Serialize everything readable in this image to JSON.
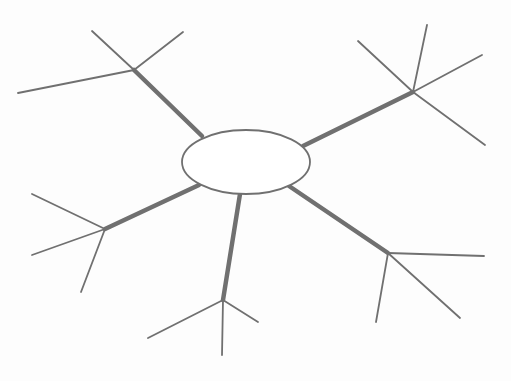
{
  "figure": {
    "type": "node-link-diagram",
    "title": "",
    "width": 511,
    "height": 381,
    "background_color": "#fdfdfd",
    "stroke_color": "#707070",
    "hub_fill_color": "#ffffff",
    "spoke_stroke_width": 4.5,
    "twig_stroke_width": 1.8,
    "hub_stroke_width": 1.8,
    "label_text": ""
  },
  "hub": {
    "name": "central-hub",
    "cx": 246,
    "cy": 162,
    "rx": 64,
    "ry": 32,
    "label": ""
  },
  "nodes": [
    {
      "id": "node-top-left",
      "label": "",
      "x": 134,
      "y": 70
    },
    {
      "id": "node-top-right",
      "label": "",
      "x": 413,
      "y": 92
    },
    {
      "id": "node-left",
      "label": "",
      "x": 105,
      "y": 229
    },
    {
      "id": "node-bottom",
      "label": "",
      "x": 223,
      "y": 300
    },
    {
      "id": "node-bottom-right",
      "label": "",
      "x": 388,
      "y": 253
    }
  ],
  "spokes": [
    {
      "id": "spoke-to-top-left",
      "from": "central-hub",
      "to": "node-top-left",
      "x1": 202,
      "y1": 136,
      "x2": 134,
      "y2": 70
    },
    {
      "id": "spoke-to-top-right",
      "from": "central-hub",
      "to": "node-top-right",
      "x1": 303,
      "y1": 146,
      "x2": 413,
      "y2": 92
    },
    {
      "id": "spoke-to-left",
      "from": "central-hub",
      "to": "node-left",
      "x1": 199,
      "y1": 185,
      "x2": 105,
      "y2": 229
    },
    {
      "id": "spoke-to-bottom",
      "from": "central-hub",
      "to": "node-bottom",
      "x1": 240,
      "y1": 194,
      "x2": 223,
      "y2": 300
    },
    {
      "id": "spoke-to-bottom-right",
      "from": "central-hub",
      "to": "node-bottom-right",
      "x1": 289,
      "y1": 186,
      "x2": 388,
      "y2": 253
    }
  ],
  "twigs": [
    {
      "id": "twig-top-left-a",
      "node": "node-top-left",
      "x1": 134,
      "y1": 70,
      "x2": 92,
      "y2": 31
    },
    {
      "id": "twig-top-left-b",
      "node": "node-top-left",
      "x1": 134,
      "y1": 70,
      "x2": 183,
      "y2": 32
    },
    {
      "id": "twig-top-left-c",
      "node": "node-top-left",
      "x1": 134,
      "y1": 70,
      "x2": 18,
      "y2": 93
    },
    {
      "id": "twig-top-right-a",
      "node": "node-top-right",
      "x1": 413,
      "y1": 92,
      "x2": 358,
      "y2": 41
    },
    {
      "id": "twig-top-right-b",
      "node": "node-top-right",
      "x1": 413,
      "y1": 92,
      "x2": 427,
      "y2": 25
    },
    {
      "id": "twig-top-right-c",
      "node": "node-top-right",
      "x1": 413,
      "y1": 92,
      "x2": 482,
      "y2": 55
    },
    {
      "id": "twig-top-right-d",
      "node": "node-top-right",
      "x1": 413,
      "y1": 92,
      "x2": 485,
      "y2": 145
    },
    {
      "id": "twig-left-a",
      "node": "node-left",
      "x1": 105,
      "y1": 229,
      "x2": 32,
      "y2": 194
    },
    {
      "id": "twig-left-b",
      "node": "node-left",
      "x1": 105,
      "y1": 229,
      "x2": 32,
      "y2": 255
    },
    {
      "id": "twig-left-c",
      "node": "node-left",
      "x1": 105,
      "y1": 229,
      "x2": 81,
      "y2": 292
    },
    {
      "id": "twig-bottom-a",
      "node": "node-bottom",
      "x1": 223,
      "y1": 300,
      "x2": 148,
      "y2": 338
    },
    {
      "id": "twig-bottom-b",
      "node": "node-bottom",
      "x1": 223,
      "y1": 300,
      "x2": 222,
      "y2": 355
    },
    {
      "id": "twig-bottom-c",
      "node": "node-bottom",
      "x1": 223,
      "y1": 300,
      "x2": 258,
      "y2": 322
    },
    {
      "id": "twig-bottom-right-a",
      "node": "node-bottom-right",
      "x1": 388,
      "y1": 253,
      "x2": 484,
      "y2": 256
    },
    {
      "id": "twig-bottom-right-b",
      "node": "node-bottom-right",
      "x1": 388,
      "y1": 253,
      "x2": 460,
      "y2": 318
    },
    {
      "id": "twig-bottom-right-c",
      "node": "node-bottom-right",
      "x1": 388,
      "y1": 253,
      "x2": 376,
      "y2": 322
    }
  ]
}
